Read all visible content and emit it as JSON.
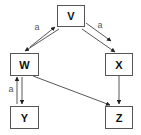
{
  "diagram": {
    "type": "directed-graph",
    "nodes": [
      {
        "id": "V",
        "label": "V",
        "x": 57,
        "y": 5,
        "w": 27,
        "h": 21
      },
      {
        "id": "W",
        "label": "W",
        "x": 10,
        "y": 53,
        "w": 28,
        "h": 22
      },
      {
        "id": "X",
        "label": "X",
        "x": 105,
        "y": 53,
        "w": 27,
        "h": 22
      },
      {
        "id": "Y",
        "label": "Y",
        "x": 10,
        "y": 106,
        "w": 28,
        "h": 22
      },
      {
        "id": "Z",
        "label": "Z",
        "x": 105,
        "y": 106,
        "w": 27,
        "h": 22
      }
    ],
    "edges": [
      {
        "from": "W",
        "to": "V",
        "label": "a",
        "x1": 30,
        "y1": 47,
        "x2": 55,
        "y2": 27,
        "lx": 37,
        "ly": 27
      },
      {
        "from": "V",
        "to": "W",
        "label": "",
        "x1": 59,
        "y1": 29,
        "x2": 25,
        "y2": 51
      },
      {
        "from": "V",
        "to": "X",
        "label": "a",
        "x1": 86,
        "y1": 23,
        "x2": 111,
        "y2": 41,
        "lx": 100,
        "ly": 25
      },
      {
        "from": "V",
        "to": "X",
        "label": "",
        "x1": 82,
        "y1": 29,
        "x2": 115,
        "y2": 52
      },
      {
        "from": "Y",
        "to": "W",
        "label": "a",
        "x1": 17,
        "y1": 104,
        "x2": 17,
        "y2": 77,
        "lx": 11,
        "ly": 89
      },
      {
        "from": "W",
        "to": "Y",
        "label": "",
        "x1": 22,
        "y1": 77,
        "x2": 22,
        "y2": 104
      },
      {
        "from": "W",
        "to": "Z",
        "label": "",
        "x1": 33,
        "y1": 76,
        "x2": 110,
        "y2": 105
      },
      {
        "from": "X",
        "to": "Z",
        "label": "",
        "x1": 119,
        "y1": 76,
        "x2": 119,
        "y2": 104
      }
    ]
  }
}
